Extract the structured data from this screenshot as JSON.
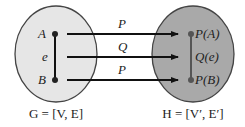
{
  "diagram": {
    "left_graph": {
      "caption": "G = [V, E]",
      "fill": "#e6e6e6",
      "vertices": [
        {
          "label": "A"
        },
        {
          "label": "B"
        }
      ],
      "edge_label": "e"
    },
    "right_graph": {
      "caption": "H = [V′, E′]",
      "fill": "#a9a9a9",
      "vertices": [
        {
          "label": "P(A)"
        },
        {
          "label": "P(B)"
        }
      ],
      "edge_label": "Q(e)"
    },
    "mappings": [
      {
        "label": "P",
        "from": "A",
        "to": "P(A)"
      },
      {
        "label": "Q",
        "from": "e",
        "to": "Q(e)"
      },
      {
        "label": "P",
        "from": "B",
        "to": "P(B)"
      }
    ]
  }
}
